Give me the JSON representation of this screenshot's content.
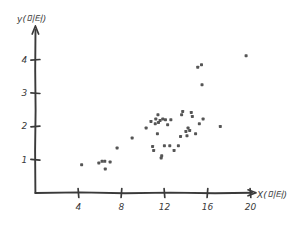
{
  "figure": {
    "style": "hand-drawn-sketch",
    "background": "#ffffff",
    "ink_color": "#3a3a3a",
    "point_color": "#555555"
  },
  "chart_data": {
    "type": "scatter",
    "title": "",
    "xlabel": "X(미터)",
    "ylabel": "y(미터)",
    "xlim": [
      0,
      22
    ],
    "ylim": [
      0,
      4.8
    ],
    "grid": false,
    "legend": null,
    "xticks": [
      4,
      8,
      12,
      16,
      20
    ],
    "xtick_labels": [
      "4",
      "8",
      "12",
      "16",
      "20"
    ],
    "yticks": [
      1,
      2,
      3,
      4
    ],
    "ytick_labels": [
      "1",
      "2",
      "3",
      "4"
    ],
    "marker": "square",
    "marker_size": 3,
    "points": [
      {
        "x": 4.3,
        "y": 0.85
      },
      {
        "x": 5.9,
        "y": 0.9
      },
      {
        "x": 6.2,
        "y": 0.95
      },
      {
        "x": 6.45,
        "y": 0.95
      },
      {
        "x": 6.5,
        "y": 0.72
      },
      {
        "x": 6.95,
        "y": 0.93
      },
      {
        "x": 7.6,
        "y": 1.35
      },
      {
        "x": 9.0,
        "y": 1.65
      },
      {
        "x": 10.3,
        "y": 1.95
      },
      {
        "x": 10.75,
        "y": 2.15
      },
      {
        "x": 10.9,
        "y": 1.4
      },
      {
        "x": 11.0,
        "y": 1.28
      },
      {
        "x": 11.15,
        "y": 2.08
      },
      {
        "x": 11.2,
        "y": 2.22
      },
      {
        "x": 11.35,
        "y": 1.78
      },
      {
        "x": 11.4,
        "y": 2.35
      },
      {
        "x": 11.45,
        "y": 2.12
      },
      {
        "x": 11.6,
        "y": 2.18
      },
      {
        "x": 11.7,
        "y": 1.05
      },
      {
        "x": 11.75,
        "y": 1.12
      },
      {
        "x": 11.85,
        "y": 2.22
      },
      {
        "x": 12.0,
        "y": 1.42
      },
      {
        "x": 12.1,
        "y": 2.2
      },
      {
        "x": 12.3,
        "y": 2.05
      },
      {
        "x": 12.5,
        "y": 1.42
      },
      {
        "x": 12.6,
        "y": 2.2
      },
      {
        "x": 12.9,
        "y": 1.28
      },
      {
        "x": 13.3,
        "y": 1.42
      },
      {
        "x": 13.5,
        "y": 1.7
      },
      {
        "x": 13.6,
        "y": 2.35
      },
      {
        "x": 13.7,
        "y": 2.45
      },
      {
        "x": 14.0,
        "y": 1.85
      },
      {
        "x": 14.1,
        "y": 1.72
      },
      {
        "x": 14.2,
        "y": 1.95
      },
      {
        "x": 14.35,
        "y": 1.88
      },
      {
        "x": 14.5,
        "y": 2.42
      },
      {
        "x": 14.6,
        "y": 2.3
      },
      {
        "x": 14.9,
        "y": 1.78
      },
      {
        "x": 15.1,
        "y": 3.78
      },
      {
        "x": 15.25,
        "y": 2.08
      },
      {
        "x": 15.45,
        "y": 3.85
      },
      {
        "x": 15.5,
        "y": 3.25
      },
      {
        "x": 15.6,
        "y": 2.22
      },
      {
        "x": 17.2,
        "y": 2.0
      },
      {
        "x": 19.6,
        "y": 4.12
      }
    ]
  }
}
